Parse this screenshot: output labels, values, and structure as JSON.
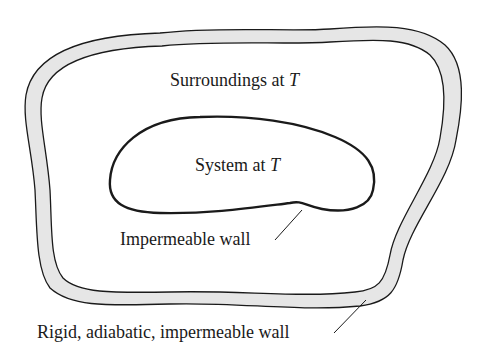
{
  "diagram": {
    "title": "",
    "colors": {
      "background": "#ffffff",
      "wall_fill": "#e6e6e6",
      "stroke": "#1a1a1a",
      "text": "#1a1a1a"
    },
    "surroundings": {
      "label": "Surroundings at ",
      "variable": "T"
    },
    "system": {
      "label": "System at ",
      "variable": "T"
    },
    "inner_wall": {
      "label": "Impermeable wall"
    },
    "outer_wall": {
      "label": "Rigid, adiabatic, impermeable wall"
    }
  }
}
